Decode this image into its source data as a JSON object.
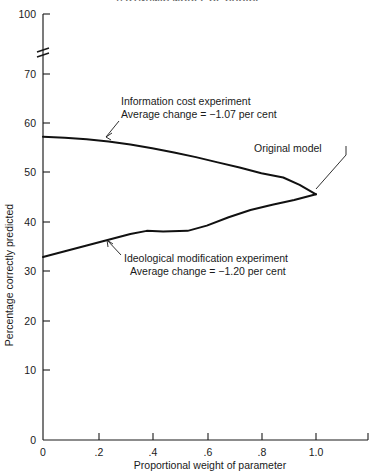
{
  "figure": {
    "clipped_title": "A DYNAMIC MODEL OF CHOICE",
    "title_visible": false
  },
  "chart_data": {
    "type": "line",
    "title": "",
    "xlabel": "Proportional weight of parameter",
    "ylabel": "Percentage correctly predicted",
    "xlim": [
      0,
      1.2
    ],
    "ylim": [
      0,
      70
    ],
    "y_axis_break": {
      "present": true,
      "below": 70,
      "above": 100,
      "style": "double-slash"
    },
    "xticks": [
      "0",
      ".2",
      ".4",
      ".6",
      ".8",
      "1.0"
    ],
    "xtick_values": [
      0,
      0.2,
      0.4,
      0.6,
      0.8,
      1.0
    ],
    "yticks": [
      "0",
      "10",
      "20",
      "30",
      "40",
      "50",
      "60",
      "70",
      "100"
    ],
    "ytick_values": [
      0,
      10,
      20,
      30,
      40,
      50,
      60,
      70,
      100
    ],
    "grid": false,
    "legend": "none (direct curve annotations)",
    "series": [
      {
        "name": "Information cost experiment",
        "x": [
          0.0,
          0.08,
          0.16,
          0.24,
          0.32,
          0.4,
          0.48,
          0.56,
          0.64,
          0.72,
          0.8,
          0.88,
          0.94,
          1.0
        ],
        "values": [
          58.0,
          57.8,
          57.5,
          57.1,
          56.5,
          55.8,
          55.0,
          54.1,
          53.1,
          52.1,
          51.0,
          50.2,
          48.8,
          47.0
        ]
      },
      {
        "name": "Ideological modification experiment",
        "x": [
          0.0,
          0.08,
          0.16,
          0.24,
          0.32,
          0.38,
          0.44,
          0.53,
          0.6,
          0.68,
          0.76,
          0.84,
          0.92,
          1.0
        ],
        "values": [
          35.0,
          36.1,
          37.2,
          38.3,
          39.4,
          40.0,
          39.9,
          40.0,
          41.0,
          42.6,
          44.0,
          45.0,
          45.9,
          47.0
        ]
      }
    ],
    "annotations": [
      {
        "name": "information-cost",
        "line1": "Information cost experiment",
        "line2": "Average change  =  −1.07 per cent",
        "points_to": {
          "x": 0.27,
          "y": 57.0
        }
      },
      {
        "name": "ideological-modification",
        "line1": "Ideological modification experiment",
        "line2": "Average change  =  −1.20 per cent",
        "points_to": {
          "x": 0.23,
          "y": 38.2
        }
      },
      {
        "name": "original-model",
        "line1": "Original model",
        "line2": "",
        "points_to": {
          "x": 1.0,
          "y": 47.0
        }
      }
    ]
  },
  "colors": {
    "curve": "#111111",
    "axis": "#1a1a1a",
    "text": "#1a1a1a",
    "background": "#ffffff"
  }
}
